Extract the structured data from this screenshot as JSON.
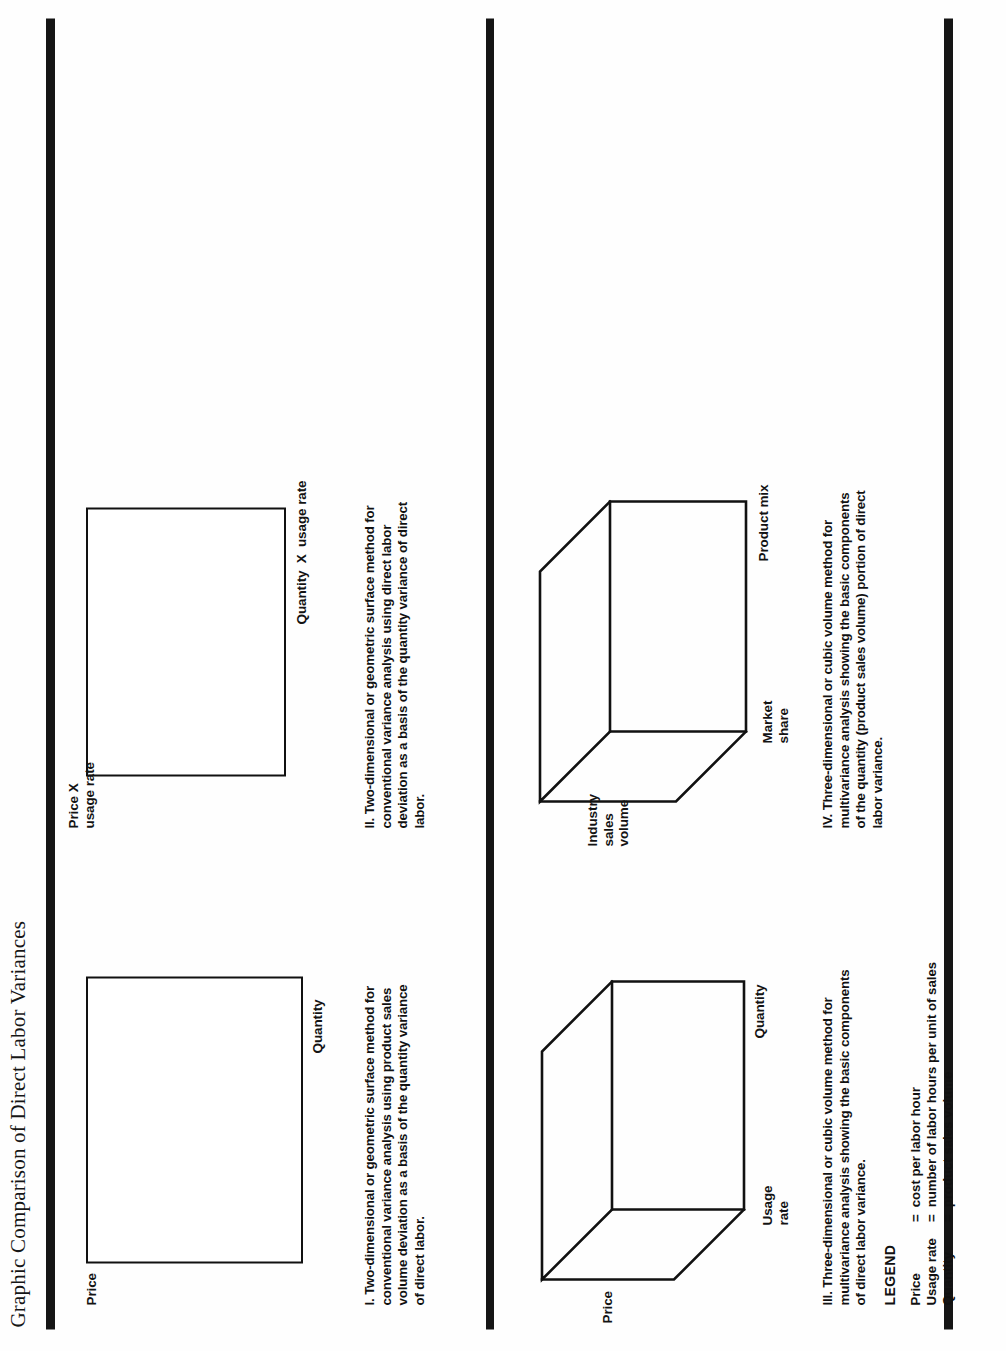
{
  "page": {
    "title": "Graphic Comparison of Direct Labor Variances",
    "background_color": "#ffffff",
    "ink_color": "#111111",
    "rotation": "figure rendered rotated 90 degrees counter-clockwise"
  },
  "rules": {
    "top": "thick-horizontal-rule",
    "middle": "thick-horizontal-rule",
    "bottom": "thick-horizontal-rule"
  },
  "panels": [
    {
      "id": "I",
      "kind": "2d-rectangle",
      "vertical_axis_label": "Price",
      "horizontal_axis_label": "Quantity",
      "caption": "I. Two-dimensional or geometric surface method for conventional variance analysis using product sales volume deviation as a basis of the quantity variance of direct labor."
    },
    {
      "id": "II",
      "kind": "2d-rectangle",
      "vertical_axis_label": "Price X\nusage rate",
      "horizontal_axis_label": "Quantity  X  usage rate",
      "caption": "II. Two-dimensional or geometric surface method for conventional variance analysis using direct labor deviation as a basis of the quantity variance of  direct labor."
    },
    {
      "id": "III",
      "kind": "3d-cube",
      "vertical_axis_label": "Price",
      "depth_axis_label": "Usage\nrate",
      "horizontal_axis_label": "Quantity",
      "caption": "III. Three-dimensional or cubic volume method for multivariance analysis showing the basic components of direct labor variance."
    },
    {
      "id": "IV",
      "kind": "3d-cube",
      "vertical_axis_label": "Industry\nsales\nvolume",
      "depth_axis_label": "Market\nshare",
      "horizontal_axis_label": "Product mix",
      "caption": "IV. Three-dimensional or cubic volume method for multivariance analysis showing the basic components of the quantity (product sales volume) portion of direct labor variance."
    }
  ],
  "legend": {
    "title": "LEGEND",
    "rows": [
      {
        "term": "Price",
        "eq": "=",
        "definition": "cost per labor hour"
      },
      {
        "term": "Usage rate",
        "eq": "=",
        "definition": "number of labor hours per unit of sales"
      },
      {
        "term": "Quantity",
        "eq": "=",
        "definition": "product sales volume"
      }
    ]
  }
}
